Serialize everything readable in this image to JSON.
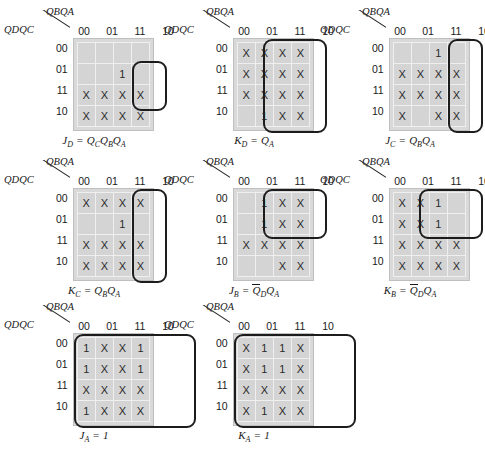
{
  "figure": {
    "row_var_label": "QDQC",
    "col_var_label": "QBQA",
    "col_headers": [
      "00",
      "01",
      "11",
      "10"
    ],
    "row_headers": [
      "00",
      "01",
      "11",
      "10"
    ],
    "colors": {
      "cell_fill": "#d4d4d4",
      "grid_pad": "#d9d9d9",
      "cell_border": "#efefef",
      "group_outline": "#1c1c1c",
      "text": "#1a1a1a"
    }
  },
  "maps": [
    {
      "id": "jd",
      "name": "J_D",
      "caption_parts": {
        "lhs": "J",
        "lhs_sub": "D",
        "eq": " = ",
        "rhs": [
          {
            "v": "Q",
            "sub": "C",
            "bar": false
          },
          {
            "v": "Q",
            "sub": "B",
            "bar": false
          },
          {
            "v": "Q",
            "sub": "A",
            "bar": false
          }
        ]
      },
      "caption_text": "JD = QCQBQA",
      "cells": [
        [
          "",
          "",
          "",
          ""
        ],
        [
          "",
          "",
          "1",
          ""
        ],
        [
          "X",
          "X",
          "X",
          "X"
        ],
        [
          "X",
          "X",
          "X",
          "X"
        ]
      ],
      "groups": [
        {
          "col": 2,
          "row": 1,
          "cols": 1,
          "rows": 2
        }
      ]
    },
    {
      "id": "kd",
      "name": "K_D",
      "caption_parts": {
        "lhs": "K",
        "lhs_sub": "D",
        "eq": " = ",
        "rhs": [
          {
            "v": "Q",
            "sub": "A",
            "bar": false
          }
        ]
      },
      "caption_text": "KD = QA",
      "cells": [
        [
          "X",
          "X",
          "X",
          "X"
        ],
        [
          "X",
          "X",
          "X",
          "X"
        ],
        [
          "X",
          "X",
          "X",
          "X"
        ],
        [
          "",
          "1",
          "X",
          "X"
        ]
      ],
      "groups": [
        {
          "col": 1,
          "row": 0,
          "cols": 2,
          "rows": 4
        }
      ]
    },
    {
      "id": "jc",
      "name": "J_C",
      "caption_parts": {
        "lhs": "J",
        "lhs_sub": "C",
        "eq": " = ",
        "rhs": [
          {
            "v": "Q",
            "sub": "B",
            "bar": false
          },
          {
            "v": "Q",
            "sub": "A",
            "bar": false
          }
        ]
      },
      "caption_text": "JC = QBQA",
      "cells": [
        [
          "",
          "",
          "1",
          ""
        ],
        [
          "X",
          "X",
          "X",
          "X"
        ],
        [
          "X",
          "X",
          "X",
          "X"
        ],
        [
          "X",
          "",
          "X",
          "X"
        ]
      ],
      "groups": [
        {
          "col": 2,
          "row": 0,
          "cols": 1,
          "rows": 4
        }
      ]
    },
    {
      "id": "kc",
      "name": "K_C",
      "caption_parts": {
        "lhs": "K",
        "lhs_sub": "C",
        "eq": " = ",
        "rhs": [
          {
            "v": "Q",
            "sub": "B",
            "bar": false
          },
          {
            "v": "Q",
            "sub": "A",
            "bar": false
          }
        ]
      },
      "caption_text": "KC = QBQA",
      "cells": [
        [
          "X",
          "X",
          "X",
          "X"
        ],
        [
          "",
          "",
          "1",
          ""
        ],
        [
          "X",
          "X",
          "X",
          "X"
        ],
        [
          "X",
          "X",
          "X",
          "X"
        ]
      ],
      "groups": [
        {
          "col": 2,
          "row": 0,
          "cols": 1,
          "rows": 4
        }
      ]
    },
    {
      "id": "jb",
      "name": "J_B",
      "caption_parts": {
        "lhs": "J",
        "lhs_sub": "B",
        "eq": " = ",
        "rhs": [
          {
            "v": "Q",
            "sub": "D",
            "bar": true
          },
          {
            "v": "Q",
            "sub": "A",
            "bar": false
          }
        ]
      },
      "caption_text": "JB = QD'QA",
      "cells": [
        [
          "",
          "1",
          "X",
          "X"
        ],
        [
          "",
          "1",
          "X",
          "X"
        ],
        [
          "X",
          "X",
          "X",
          "X"
        ],
        [
          "",
          "",
          "X",
          "X"
        ]
      ],
      "groups": [
        {
          "col": 1,
          "row": 0,
          "cols": 2,
          "rows": 2
        }
      ]
    },
    {
      "id": "kb",
      "name": "K_B",
      "caption_parts": {
        "lhs": "K",
        "lhs_sub": "B",
        "eq": " = ",
        "rhs": [
          {
            "v": "Q",
            "sub": "D",
            "bar": true
          },
          {
            "v": "Q",
            "sub": "A",
            "bar": false
          }
        ]
      },
      "caption_text": "KB = QD'QA",
      "cells": [
        [
          "X",
          "X",
          "1",
          ""
        ],
        [
          "X",
          "X",
          "1",
          ""
        ],
        [
          "X",
          "X",
          "X",
          "X"
        ],
        [
          "X",
          "X",
          "X",
          "X"
        ]
      ],
      "groups": [
        {
          "col": 1,
          "row": 0,
          "cols": 2,
          "rows": 2
        }
      ]
    },
    {
      "id": "ja",
      "name": "J_A",
      "caption_parts": {
        "lhs": "J",
        "lhs_sub": "A",
        "eq": " = ",
        "rhs": [
          {
            "v": "1",
            "sub": "",
            "bar": false
          }
        ]
      },
      "caption_text": "JA = 1",
      "cells": [
        [
          "1",
          "X",
          "X",
          "1"
        ],
        [
          "1",
          "X",
          "X",
          "1"
        ],
        [
          "X",
          "X",
          "X",
          "X"
        ],
        [
          "1",
          "X",
          "X",
          "X"
        ]
      ],
      "groups": [
        {
          "col": 0,
          "row": 0,
          "cols": 4,
          "rows": 4
        }
      ]
    },
    {
      "id": "ka",
      "name": "K_A",
      "caption_parts": {
        "lhs": "K",
        "lhs_sub": "A",
        "eq": " = ",
        "rhs": [
          {
            "v": "1",
            "sub": "",
            "bar": false
          }
        ]
      },
      "caption_text": "KA = 1",
      "cells": [
        [
          "X",
          "1",
          "1",
          "X"
        ],
        [
          "X",
          "1",
          "1",
          "X"
        ],
        [
          "X",
          "X",
          "X",
          "X"
        ],
        [
          "X",
          "1",
          "X",
          "X"
        ]
      ],
      "groups": [
        {
          "col": 0,
          "row": 0,
          "cols": 4,
          "rows": 4
        }
      ]
    }
  ],
  "layout": {
    "positions": [
      {
        "id": "jd",
        "x": 4,
        "y": 8
      },
      {
        "id": "kd",
        "x": 164,
        "y": 8
      },
      {
        "id": "jc",
        "x": 320,
        "y": 8
      },
      {
        "id": "kc",
        "x": 4,
        "y": 158
      },
      {
        "id": "jb",
        "x": 164,
        "y": 158
      },
      {
        "id": "kb",
        "x": 320,
        "y": 158
      },
      {
        "id": "ja",
        "x": 4,
        "y": 303
      },
      {
        "id": "ka",
        "x": 164,
        "y": 303
      }
    ]
  }
}
